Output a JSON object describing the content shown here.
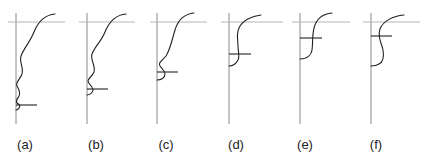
{
  "figure": {
    "panels": [
      {
        "id": "a",
        "label": "(a)",
        "axis_x": 16,
        "label_x": 20
      },
      {
        "id": "b",
        "label": "(b)",
        "axis_x": 87,
        "label_x": 91
      },
      {
        "id": "c",
        "label": "(c)",
        "axis_x": 157,
        "label_x": 161
      },
      {
        "id": "d",
        "label": "(d)",
        "axis_x": 229,
        "label_x": 233
      },
      {
        "id": "e",
        "label": "(e)",
        "axis_x": 300,
        "label_x": 304
      },
      {
        "id": "f",
        "label": "(f)",
        "axis_x": 371,
        "label_x": 375
      }
    ],
    "colors": {
      "curve": "#222222",
      "axis": "#8a8a8a",
      "reference_line": "#b5b5b5",
      "background": "#ffffff"
    }
  }
}
